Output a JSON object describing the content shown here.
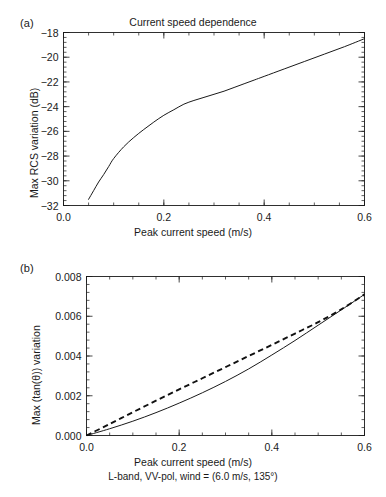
{
  "figure": {
    "background": "#ffffff",
    "foreground": "#1a1a1a"
  },
  "panel_a": {
    "label": "(a)",
    "title": "Current speed dependence",
    "xlabel": "Peak current speed (m/s)",
    "ylabel": "Max RCS variation (dB)",
    "xticks": [
      "0.0",
      "0.2",
      "0.4",
      "0.6"
    ],
    "yticks": [
      "−18",
      "−20",
      "−22",
      "−24",
      "−26",
      "−28",
      "−30",
      "−32"
    ]
  },
  "panel_b": {
    "label": "(b)",
    "xlabel": "Peak current speed (m/s)",
    "caption": "L-band, VV-pol, wind = (6.0 m/s, 135°)",
    "ylabel": "Max (tan(θ)) variation",
    "xticks": [
      "0.0",
      "0.2",
      "0.4",
      "0.6"
    ],
    "yticks": [
      "0.008",
      "0.006",
      "0.004",
      "0.002",
      "0.000"
    ]
  },
  "chart_data": [
    {
      "type": "line",
      "panel": "(a)",
      "title": "Current speed dependence",
      "xlabel": "Peak current speed (m/s)",
      "ylabel": "Max RCS variation (dB)",
      "xlim": [
        0.0,
        0.6
      ],
      "ylim": [
        -32,
        -18
      ],
      "xticks": [
        0.0,
        0.2,
        0.4,
        0.6
      ],
      "yticks": [
        -32,
        -30,
        -28,
        -26,
        -24,
        -22,
        -20,
        -18
      ],
      "grid": false,
      "legend": "none",
      "series": [
        {
          "name": "Max RCS variation",
          "style": "solid",
          "color": "#1a1a1a",
          "x": [
            0.05,
            0.06,
            0.07,
            0.08,
            0.09,
            0.1,
            0.12,
            0.14,
            0.16,
            0.18,
            0.2,
            0.22,
            0.24,
            0.26,
            0.28,
            0.3,
            0.32,
            0.34,
            0.36,
            0.38,
            0.4,
            0.44,
            0.48,
            0.52,
            0.56,
            0.6
          ],
          "y": [
            -31.5,
            -30.8,
            -30.1,
            -29.5,
            -28.85,
            -28.2,
            -27.25,
            -26.5,
            -25.85,
            -25.25,
            -24.7,
            -24.25,
            -23.8,
            -23.5,
            -23.25,
            -23.0,
            -22.75,
            -22.45,
            -22.15,
            -21.85,
            -21.55,
            -20.95,
            -20.35,
            -19.75,
            -19.15,
            -18.5
          ]
        }
      ]
    },
    {
      "type": "line",
      "panel": "(b)",
      "title": "",
      "xlabel": "Peak current speed (m/s)",
      "ylabel": "Max (tan(θ)) variation",
      "xlim": [
        0.0,
        0.6
      ],
      "ylim": [
        0.0,
        0.008
      ],
      "xticks": [
        0.0,
        0.2,
        0.4,
        0.6
      ],
      "yticks": [
        0.0,
        0.002,
        0.004,
        0.006,
        0.008
      ],
      "grid": false,
      "legend": "none",
      "series": [
        {
          "name": "Max tan(theta) variation",
          "style": "solid",
          "color": "#1a1a1a",
          "x": [
            0.0,
            0.05,
            0.1,
            0.15,
            0.2,
            0.25,
            0.3,
            0.35,
            0.4,
            0.45,
            0.5,
            0.55,
            0.6
          ],
          "y": [
            0.0,
            0.00034,
            0.00072,
            0.00115,
            0.00163,
            0.00215,
            0.00272,
            0.00335,
            0.00405,
            0.00478,
            0.00555,
            0.00632,
            0.0071
          ]
        },
        {
          "name": "Linear reference",
          "style": "dashed",
          "color": "#111111",
          "x": [
            0.0,
            0.05,
            0.1,
            0.15,
            0.2,
            0.25,
            0.3,
            0.35,
            0.4,
            0.45,
            0.5,
            0.55,
            0.6
          ],
          "y": [
            0.0,
            0.00058,
            0.00117,
            0.00175,
            0.00232,
            0.00288,
            0.00344,
            0.004,
            0.00456,
            0.00513,
            0.0057,
            0.00635,
            0.0071
          ]
        }
      ]
    }
  ]
}
